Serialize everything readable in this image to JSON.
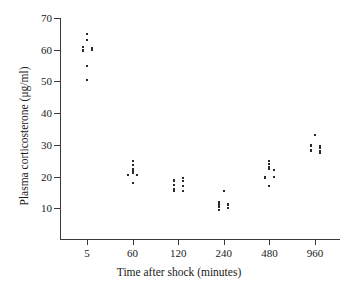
{
  "chart_data": {
    "type": "scatter",
    "title": "",
    "xlabel": "Time after shock (minutes)",
    "ylabel": "Plasma corticosterone (μg/ml)",
    "grid": false,
    "legend": "none",
    "x_scale": "categorical",
    "categories": [
      "5",
      "60",
      "120",
      "240",
      "480",
      "960"
    ],
    "ylim": [
      0,
      70
    ],
    "yticks": [
      10,
      20,
      30,
      40,
      50,
      60,
      70
    ],
    "ytick_labels": [
      "10",
      "20",
      "30",
      "40",
      "50",
      "60",
      "70"
    ],
    "xtick_labels": [
      "5",
      "60",
      "120",
      "240",
      "480",
      "960"
    ],
    "marker": "dot",
    "marker_color": "#2a2a2a",
    "series": [
      {
        "name": "Plasma corticosterone",
        "groups": [
          {
            "category": "5",
            "values": [
              65.0,
              63.0,
              61.0,
              60.5,
              60.0,
              60.0,
              59.5,
              55.0,
              50.5
            ],
            "jitter": [
              0,
              0,
              -1,
              1,
              -1,
              1,
              -1,
              0,
              0
            ]
          },
          {
            "category": "60",
            "values": [
              25.0,
              23.5,
              22.5,
              22.0,
              21.5,
              21.0,
              20.5,
              20.5,
              18.0
            ],
            "jitter": [
              0,
              0,
              0,
              0,
              0,
              0,
              -1,
              1,
              0
            ]
          },
          {
            "category": "120",
            "values": [
              19.5,
              19.0,
              18.5,
              18.5,
              17.5,
              17.0,
              16.0,
              15.5,
              15.5
            ],
            "jitter": [
              1,
              -1,
              -1,
              1,
              -1,
              1,
              -1,
              -1,
              1
            ]
          },
          {
            "category": "240",
            "values": [
              15.5,
              12.0,
              11.5,
              11.5,
              11.0,
              11.0,
              10.5,
              10.0,
              9.5
            ],
            "jitter": [
              0,
              -1,
              -1,
              1,
              -1,
              1,
              -1,
              1,
              -1
            ]
          },
          {
            "category": "480",
            "values": [
              25.0,
              24.0,
              23.0,
              22.5,
              22.0,
              20.0,
              20.0,
              19.5,
              17.0
            ],
            "jitter": [
              0,
              0,
              0,
              0,
              1,
              -1,
              1,
              -1,
              0
            ]
          },
          {
            "category": "960",
            "values": [
              33.0,
              30.0,
              29.5,
              29.5,
              29.0,
              28.5,
              28.0,
              28.0,
              27.5
            ],
            "jitter": [
              0,
              -1,
              1,
              -1,
              1,
              -1,
              1,
              -1,
              1
            ]
          }
        ]
      }
    ]
  },
  "axes": {
    "y_title": "Plasma corticosterone (μg/ml)",
    "x_title": "Time after shock (minutes)"
  }
}
